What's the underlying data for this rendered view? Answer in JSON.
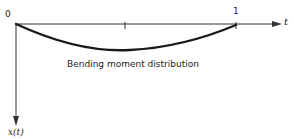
{
  "diagram": {
    "origin_label": "0",
    "end_label": "1",
    "horizontal_axis_label": "t",
    "vertical_axis_label": "x(t)",
    "curve_caption": "Bending moment distribution",
    "colors": {
      "axis": "#333333",
      "curve": "#1a1a1a",
      "text": "#222222"
    },
    "curve": {
      "description": "downward sag between t=0 and t=1, deepest slightly right of midpoint",
      "points_t": [
        0,
        0.5,
        1
      ],
      "note": "curve drawn below axis (positive x downward)"
    }
  }
}
